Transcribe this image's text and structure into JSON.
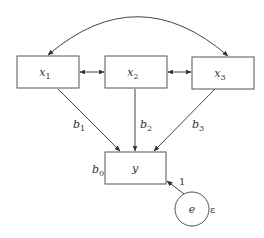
{
  "diagram": {
    "type": "path-diagram",
    "nodes": [
      {
        "id": "x1",
        "label": "x",
        "subscript": "1",
        "shape": "rect"
      },
      {
        "id": "x2",
        "label": "x",
        "subscript": "2",
        "shape": "rect"
      },
      {
        "id": "x3",
        "label": "x",
        "subscript": "3",
        "shape": "rect"
      },
      {
        "id": "y",
        "label": "y",
        "subscript": "",
        "shape": "rect",
        "intercept_label": "b",
        "intercept_subscript": "0"
      },
      {
        "id": "e",
        "label": "e",
        "subscript": "",
        "shape": "circle",
        "variance_label": "ε"
      }
    ],
    "edges": [
      {
        "from": "x1",
        "to": "x3",
        "type": "covariance-curved",
        "label": ""
      },
      {
        "from": "x1",
        "to": "x2",
        "type": "covariance",
        "label": ""
      },
      {
        "from": "x2",
        "to": "x3",
        "type": "covariance",
        "label": ""
      },
      {
        "from": "x1",
        "to": "y",
        "type": "path",
        "label": "b",
        "subscript": "1"
      },
      {
        "from": "x2",
        "to": "y",
        "type": "path",
        "label": "b",
        "subscript": "2"
      },
      {
        "from": "x3",
        "to": "y",
        "type": "path",
        "label": "b",
        "subscript": "3"
      },
      {
        "from": "e",
        "to": "y",
        "type": "path",
        "label": "1",
        "subscript": ""
      }
    ]
  }
}
